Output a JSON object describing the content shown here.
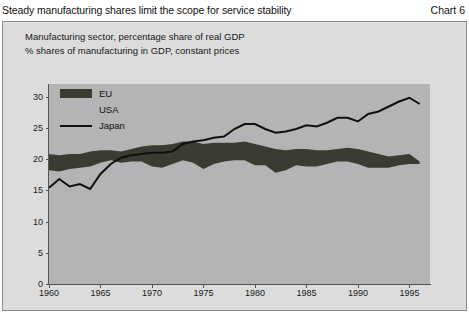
{
  "header": {
    "title": "Steady manufacturing shares limit the scope for service stability",
    "chart_number": "Chart 6"
  },
  "subtitle": {
    "line1": "Manufacturing sector, percentage share of real GDP",
    "line2": "% shares of manufacturing in GDP, constant prices"
  },
  "legend": {
    "items": [
      {
        "label": "EU",
        "marker": "area-swatch",
        "color": "#3b3b32"
      },
      {
        "label": "USA",
        "marker": "area-swatch",
        "color": "#b4b4b4"
      },
      {
        "label": "Japan",
        "marker": "line-swatch",
        "color": "#101010"
      }
    ]
  },
  "colors": {
    "page_background": "#ffffff",
    "panel_background": "#dcdcdc",
    "plot_background": "#b4b4b4",
    "eu_fill": "#3b3b32",
    "usa_fill": "#b4b4b4",
    "japan_line": "#101010",
    "axis": "#555555",
    "text": "#1a1a1a"
  },
  "chart_data": {
    "type": "area",
    "title": "Manufacturing sector, percentage share of real GDP",
    "subtitle": "% shares of manufacturing in GDP, constant prices",
    "xlabel": "",
    "ylabel": "",
    "xlim": [
      1960,
      1997
    ],
    "ylim": [
      0,
      32
    ],
    "yticks": [
      0,
      5,
      10,
      15,
      20,
      25,
      30
    ],
    "xticks": [
      1960,
      1965,
      1970,
      1975,
      1980,
      1985,
      1990,
      1995
    ],
    "grid": false,
    "legend_position": "top-left",
    "x": [
      1960,
      1961,
      1962,
      1963,
      1964,
      1965,
      1966,
      1967,
      1968,
      1969,
      1970,
      1971,
      1972,
      1973,
      1974,
      1975,
      1976,
      1977,
      1978,
      1979,
      1980,
      1981,
      1982,
      1983,
      1984,
      1985,
      1986,
      1987,
      1988,
      1989,
      1990,
      1991,
      1992,
      1993,
      1994,
      1995,
      1996
    ],
    "series": [
      {
        "name": "USA",
        "fill_color": "#b4b4b4",
        "note": "lower band, plotted from 0 up to its value",
        "values": [
          18.2,
          18.0,
          18.4,
          18.6,
          18.8,
          19.4,
          19.8,
          19.4,
          19.6,
          19.6,
          18.8,
          18.6,
          19.2,
          19.8,
          19.4,
          18.4,
          19.2,
          19.6,
          19.8,
          19.8,
          19.0,
          19.0,
          17.8,
          18.2,
          19.0,
          18.8,
          18.8,
          19.2,
          19.6,
          19.6,
          19.2,
          18.6,
          18.6,
          18.6,
          19.0,
          19.2,
          19.2
        ],
        "ylim_units": "% of GDP"
      },
      {
        "name": "EU",
        "fill_color": "#3b3b32",
        "note": "upper band top edge (absolute value, band drawn between USA and EU)",
        "values": [
          20.8,
          20.6,
          20.8,
          20.8,
          21.2,
          21.4,
          21.4,
          21.2,
          21.6,
          22.0,
          22.2,
          22.2,
          22.4,
          22.8,
          22.8,
          22.4,
          22.6,
          22.6,
          22.6,
          22.8,
          22.4,
          22.0,
          21.6,
          21.4,
          21.6,
          21.6,
          21.4,
          21.4,
          21.6,
          21.8,
          21.6,
          21.2,
          20.8,
          20.4,
          20.6,
          20.8,
          19.6
        ]
      },
      {
        "name": "Japan",
        "line_color": "#101010",
        "note": "line series",
        "values": [
          15.4,
          16.8,
          15.6,
          16.0,
          15.2,
          17.6,
          19.2,
          20.2,
          20.6,
          20.8,
          21.0,
          21.0,
          21.2,
          22.4,
          22.8,
          23.0,
          23.4,
          23.6,
          24.8,
          25.6,
          25.6,
          24.8,
          24.2,
          24.4,
          24.8,
          25.4,
          25.2,
          25.8,
          26.6,
          26.6,
          26.0,
          27.2,
          27.6,
          28.4,
          29.2,
          29.8,
          28.8
        ]
      }
    ]
  }
}
